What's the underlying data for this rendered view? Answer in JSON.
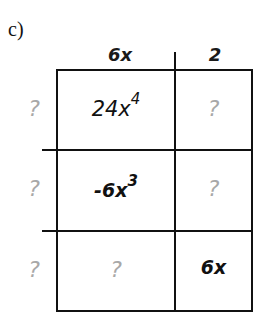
{
  "problem_label": "c)",
  "column_headers": [
    "6x",
    "2"
  ],
  "row_headers": [
    "?",
    "?",
    "?"
  ],
  "cells": [
    [
      {
        "base": "24x",
        "exp": "4"
      },
      {
        "base": "?",
        "exp": ""
      }
    ],
    [
      {
        "base": "-6x",
        "exp": "3"
      },
      {
        "base": "?",
        "exp": ""
      }
    ],
    [
      {
        "base": "?",
        "exp": ""
      },
      {
        "base": "6x",
        "exp": ""
      }
    ]
  ],
  "colors": {
    "line": "#111111",
    "unknown": "#a8a8a8",
    "text": "#111111"
  }
}
